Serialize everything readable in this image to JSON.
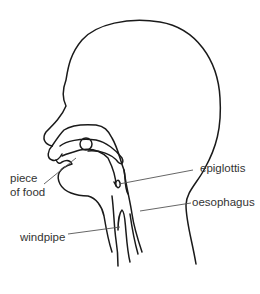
{
  "diagram": {
    "title": "",
    "line_color": "#1a1a1a",
    "label_color": "#333333",
    "labels": {
      "piece_of_food_line1": "piece",
      "piece_of_food_line2": "of food",
      "epiglottis": "epiglottis",
      "oesophagus": "oesophagus",
      "windpipe": "windpipe"
    }
  }
}
